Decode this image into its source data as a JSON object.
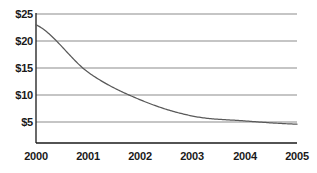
{
  "chart_data": {
    "type": "line",
    "title": "",
    "xlabel": "",
    "ylabel": "",
    "x": [
      2000,
      2001,
      2002,
      2003,
      2004,
      2005
    ],
    "categories": [
      "2000",
      "2001",
      "2002",
      "2003",
      "2004",
      "2005"
    ],
    "values": [
      23.0,
      14.2,
      9.1,
      6.1,
      5.2,
      4.6
    ],
    "series": [
      {
        "name": "",
        "values": [
          23.0,
          14.2,
          9.1,
          6.1,
          5.2,
          4.6
        ]
      }
    ],
    "ylim": [
      0,
      25
    ],
    "xlim": [
      2000,
      2005
    ],
    "y_ticks": [
      25,
      20,
      15,
      10,
      5
    ],
    "y_tick_labels": [
      "$25",
      "$20",
      "$15",
      "$10",
      "$5"
    ],
    "x_ticks": [
      2000,
      2001,
      2002,
      2003,
      2004,
      2005
    ],
    "x_tick_labels": [
      "2000",
      "2001",
      "2002",
      "2003",
      "2004",
      "2005"
    ],
    "grid": true,
    "grid_axis": "y",
    "legend": false,
    "legend_position": "none",
    "line_color": "#595959",
    "grid_color": "#8c8c8c",
    "axis_color": "#1a1a1a",
    "background_color": "#ffffff",
    "text_color": "#1a1a1a",
    "annotations": []
  }
}
